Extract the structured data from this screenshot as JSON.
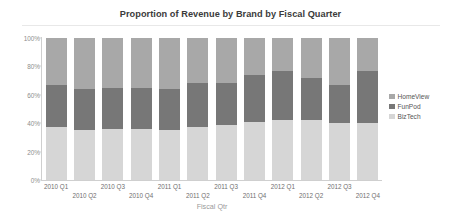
{
  "chart_data": {
    "type": "bar",
    "stacked": true,
    "normalized": true,
    "title": "Proportion of Revenue by Brand by Fiscal Quarter",
    "xlabel": "Fiscal Qtr",
    "ylabel": "",
    "ylim": [
      0,
      100
    ],
    "yticks": [
      "0%",
      "20%",
      "40%",
      "60%",
      "80%",
      "100%"
    ],
    "ytick_values": [
      0,
      20,
      40,
      60,
      80,
      100
    ],
    "grid": false,
    "legend_position": "right",
    "categories": [
      "2010 Q1",
      "2010 Q2",
      "2010 Q3",
      "2010 Q4",
      "2011 Q1",
      "2011 Q2",
      "2011 Q3",
      "2011 Q4",
      "2012 Q1",
      "2012 Q2",
      "2012 Q3",
      "2012 Q4"
    ],
    "series": [
      {
        "name": "BizTech",
        "color": "#d6d6d6",
        "values": [
          37,
          35,
          36,
          36,
          35,
          37,
          39,
          41,
          42,
          42,
          40,
          40
        ]
      },
      {
        "name": "FunPod",
        "color": "#777777",
        "values": [
          30,
          29,
          29,
          29,
          29,
          31,
          29,
          33,
          35,
          30,
          27,
          37
        ]
      },
      {
        "name": "HomeView",
        "color": "#a8a8a8",
        "values": [
          33,
          36,
          35,
          35,
          36,
          32,
          32,
          26,
          23,
          28,
          33,
          23
        ]
      }
    ],
    "legend": [
      {
        "label": "HomeView",
        "color": "#a8a8a8"
      },
      {
        "label": "FunPod",
        "color": "#777777"
      },
      {
        "label": "BizTech",
        "color": "#d6d6d6"
      }
    ]
  }
}
